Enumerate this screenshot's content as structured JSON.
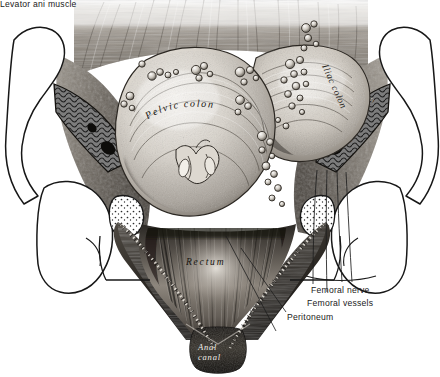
{
  "figure": {
    "background_color": "#ffffff",
    "ink_color": "#1a1a1a",
    "technique": "monochrome engraving / stipple-and-hatch halftone"
  },
  "callouts": [
    {
      "id": "femoral-nerve",
      "label": "Femoral nerve",
      "x": 311,
      "y": 286
    },
    {
      "id": "femoral-vessels",
      "label": "Femoral vessels",
      "x": 307,
      "y": 299
    },
    {
      "id": "peritoneum",
      "label": "Peritoneum",
      "x": 287,
      "y": 313
    },
    {
      "id": "levator-ani",
      "label": "Levator ani muscle",
      "x": 277,
      "y": 333
    }
  ],
  "inline_labels": [
    {
      "id": "pelvic-colon",
      "text": "Pelvic colon",
      "style": "cursive-curved",
      "x": 150,
      "y": 113
    },
    {
      "id": "iliac-colon",
      "text": "Iliac colon",
      "style": "cursive-rotated",
      "x": 330,
      "y": 70
    },
    {
      "id": "ilio-psoas",
      "text": "ILIO-PSOAS",
      "style": "caps-rotated",
      "x": 348,
      "y": 143
    },
    {
      "id": "rectum",
      "text": "Rectum",
      "style": "cursive-spaced",
      "x": 205,
      "y": 262
    },
    {
      "id": "anal-canal-1",
      "text": "Anal",
      "style": "cursive-white",
      "x": 208,
      "y": 346
    },
    {
      "id": "anal-canal-2",
      "text": "canal",
      "style": "cursive-white",
      "x": 209,
      "y": 356
    }
  ],
  "structures": [
    {
      "id": "pelvic-colon",
      "name": "Pelvic colon",
      "note": "large central loop studded with nodular deposits"
    },
    {
      "id": "iliac-colon",
      "name": "Iliac colon",
      "note": "upper-right loop with nodular deposits"
    },
    {
      "id": "rectum",
      "name": "Rectum",
      "note": "funnel of longitudinal muscle fibres below the colon"
    },
    {
      "id": "anal-canal",
      "name": "Anal canal",
      "note": "dark terminal segment at the apex"
    },
    {
      "id": "levator-ani",
      "name": "Levator ani muscle",
      "note": "paired sheets flanking the rectum"
    },
    {
      "id": "peritoneum",
      "name": "Peritoneum",
      "note": "dotted reflection line along the pelvic wall"
    },
    {
      "id": "ilio-psoas",
      "name": "Ilio-psoas muscle",
      "note": "cut cross-section on the pelvic side wall"
    },
    {
      "id": "iliac-crest-l",
      "name": "Left iliac crest",
      "note": "outlined bone, cut muscle in section"
    },
    {
      "id": "iliac-crest-r",
      "name": "Right iliac crest",
      "note": "outlined bone, cut muscle in section"
    },
    {
      "id": "femur-head-l",
      "name": "Left femur / hip",
      "note": "outlined with stippled cut surface"
    },
    {
      "id": "femur-head-r",
      "name": "Right femur / hip",
      "note": "outlined with stippled cut surface"
    },
    {
      "id": "femoral-nerve",
      "name": "Femoral nerve",
      "note": "leader line descending in the thigh"
    },
    {
      "id": "femoral-vessels",
      "name": "Femoral vessels",
      "note": "leader line descending in the thigh"
    }
  ]
}
